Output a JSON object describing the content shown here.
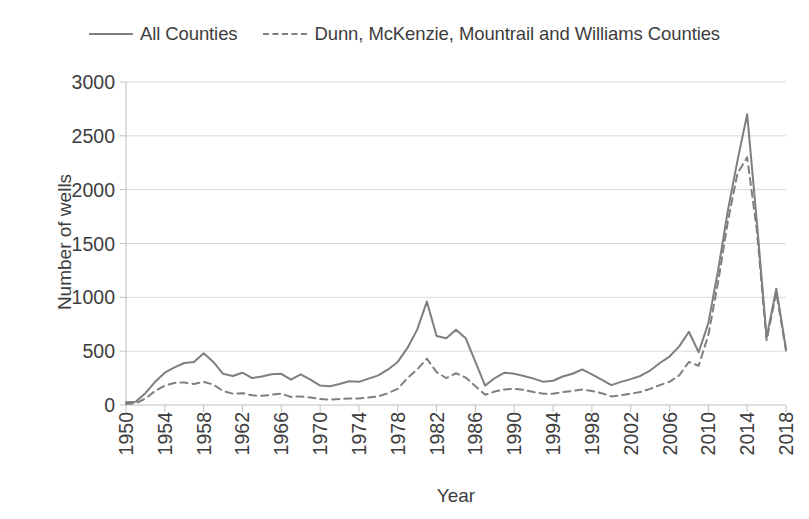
{
  "chart_data": {
    "type": "line",
    "title": "",
    "xlabel": "Year",
    "ylabel": "Number of wells",
    "xlim": [
      1950,
      2018
    ],
    "ylim": [
      0,
      3000
    ],
    "ytick_values": [
      0,
      500,
      1000,
      1500,
      2000,
      2500,
      3000
    ],
    "ytick_labels": [
      "0",
      "500",
      "1000",
      "1500",
      "2000",
      "2500",
      "3000"
    ],
    "xtick_values": [
      1950,
      1954,
      1958,
      1962,
      1966,
      1970,
      1974,
      1978,
      1982,
      1986,
      1990,
      1994,
      1998,
      2002,
      2006,
      2010,
      2014,
      2018
    ],
    "xtick_labels": [
      "1950",
      "1954",
      "1958",
      "1962",
      "1966",
      "1970",
      "1974",
      "1978",
      "1982",
      "1986",
      "1990",
      "1994",
      "1998",
      "2002",
      "2006",
      "2010",
      "2014",
      "2018"
    ],
    "grid": "horizontal",
    "legend_position": "top-center",
    "x": [
      1950,
      1951,
      1952,
      1953,
      1954,
      1955,
      1956,
      1957,
      1958,
      1959,
      1960,
      1961,
      1962,
      1963,
      1964,
      1965,
      1966,
      1967,
      1968,
      1969,
      1970,
      1971,
      1972,
      1973,
      1974,
      1975,
      1976,
      1977,
      1978,
      1979,
      1980,
      1981,
      1982,
      1983,
      1984,
      1985,
      1986,
      1987,
      1988,
      1989,
      1990,
      1991,
      1992,
      1993,
      1994,
      1995,
      1996,
      1997,
      1998,
      1999,
      2000,
      2001,
      2002,
      2003,
      2004,
      2005,
      2006,
      2007,
      2008,
      2009,
      2010,
      2011,
      2012,
      2013,
      2014,
      2015,
      2016,
      2017,
      2018
    ],
    "series": [
      {
        "name": "All Counties",
        "style": "solid",
        "color": "#7f7f7f",
        "values": [
          25,
          30,
          110,
          215,
          300,
          350,
          390,
          400,
          480,
          400,
          290,
          270,
          300,
          250,
          265,
          285,
          290,
          235,
          285,
          235,
          180,
          175,
          195,
          220,
          215,
          245,
          275,
          330,
          400,
          530,
          700,
          960,
          640,
          620,
          700,
          620,
          400,
          180,
          250,
          300,
          290,
          270,
          245,
          215,
          225,
          265,
          290,
          330,
          285,
          235,
          185,
          215,
          240,
          270,
          320,
          390,
          450,
          545,
          680,
          490,
          760,
          1250,
          1800,
          2270,
          2700,
          1700,
          630,
          1080,
          520
        ]
      },
      {
        "name": "Dunn, McKenzie, Mountrail and Williams Counties",
        "style": "dashed",
        "color": "#7f7f7f",
        "values": [
          10,
          15,
          60,
          130,
          180,
          205,
          210,
          195,
          215,
          190,
          130,
          105,
          110,
          90,
          85,
          95,
          105,
          75,
          80,
          70,
          55,
          50,
          55,
          60,
          60,
          70,
          80,
          110,
          150,
          250,
          330,
          430,
          305,
          250,
          295,
          255,
          175,
          95,
          125,
          145,
          150,
          140,
          120,
          105,
          105,
          120,
          130,
          145,
          130,
          110,
          80,
          90,
          105,
          120,
          150,
          185,
          215,
          275,
          400,
          365,
          650,
          1140,
          1700,
          2150,
          2300,
          1620,
          600,
          1045,
          505
        ]
      }
    ]
  },
  "legend": {
    "entries": [
      {
        "label": "All Counties",
        "style": "solid"
      },
      {
        "label": "Dunn, McKenzie, Mountrail and Williams Counties",
        "style": "dashed"
      }
    ]
  },
  "axes": {
    "y_title": "Number of wells",
    "x_title": "Year"
  },
  "colors": {
    "line": "#7f7f7f",
    "grid": "#d9d9d9",
    "axis": "#bfbfbf",
    "text": "#3d3d3d",
    "background": "#ffffff"
  }
}
